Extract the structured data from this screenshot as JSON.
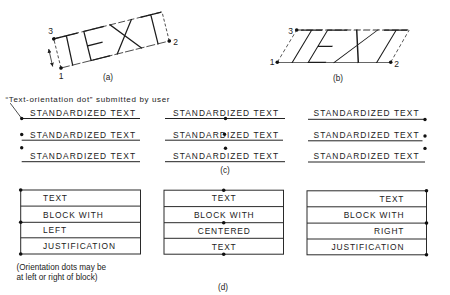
{
  "colors": {
    "ink": "#222222",
    "background": "#ffffff"
  },
  "figure_a": {
    "word": "TEXT",
    "point_labels": {
      "p1": "1",
      "p2": "2",
      "p3": "3"
    },
    "label": "(a)"
  },
  "figure_b": {
    "word": "TEXT",
    "point_labels": {
      "p1": "1",
      "p2": "2",
      "p3": "3"
    },
    "label": "(b)"
  },
  "figure_c": {
    "caption": "“Text-orientation dot” submitted by user",
    "label": "(c)",
    "columns": [
      {
        "justification": "left",
        "rows": [
          {
            "text": "STANDARDIZED TEXT",
            "dot": "left-baseline"
          },
          {
            "text": "STANDARDIZED TEXT",
            "dot": "left-middle"
          },
          {
            "text": "STANDARDIZED TEXT",
            "dot": "left-top"
          }
        ]
      },
      {
        "justification": "center",
        "rows": [
          {
            "text": "STANDARDIZED TEXT",
            "dot": "center-baseline"
          },
          {
            "text": "STANDARDIZED TEXT",
            "dot": "center-middle"
          },
          {
            "text": "STANDARDIZED TEXT",
            "dot": "center-top"
          }
        ]
      },
      {
        "justification": "right",
        "rows": [
          {
            "text": "STANDARDIZED TEXT",
            "dot": "right-baseline"
          },
          {
            "text": "STANDARDIZED TEXT",
            "dot": "right-middle"
          },
          {
            "text": "STANDARDIZED TEXT",
            "dot": "right-top"
          }
        ]
      }
    ]
  },
  "figure_d": {
    "label": "(d)",
    "note_lines": [
      "(Orientation dots may be",
      "at left or right of block)"
    ],
    "blocks": [
      {
        "justification": "left",
        "lines": [
          "TEXT",
          "BLOCK WITH",
          "LEFT",
          "JUSTIFICATION"
        ]
      },
      {
        "justification": "center",
        "lines": [
          "TEXT",
          "BLOCK WITH",
          "CENTERED",
          "TEXT"
        ]
      },
      {
        "justification": "right",
        "lines": [
          "TEXT",
          "BLOCK WITH",
          "RIGHT",
          "JUSTIFICATION"
        ]
      }
    ]
  }
}
